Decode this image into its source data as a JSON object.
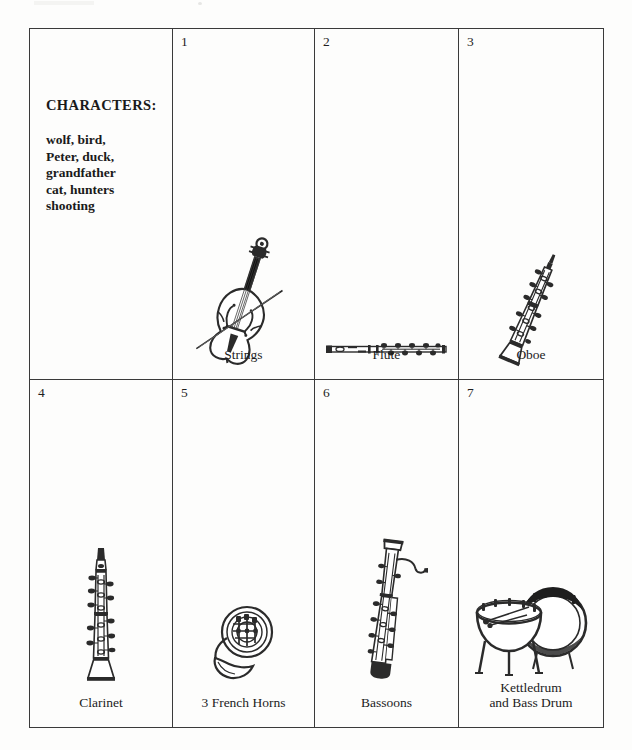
{
  "document": {
    "title": "Peter and the Wolf instrument chart",
    "background_color": "#fdfdfc",
    "border_color": "#3a3a3a",
    "ink_color": "#1a1a1a"
  },
  "characters_cell": {
    "heading": "CHARACTERS:",
    "lines": [
      "wolf, bird,",
      "Peter, duck,",
      "grandfather",
      "cat, hunters",
      "shooting"
    ]
  },
  "cells": [
    {
      "number": "1",
      "label": "Strings",
      "icon": "double-bass-icon",
      "label_lines": [
        "Strings"
      ]
    },
    {
      "number": "2",
      "label": "Flute",
      "icon": "flute-icon",
      "label_lines": [
        "Flute"
      ]
    },
    {
      "number": "3",
      "label": "Oboe",
      "icon": "oboe-icon",
      "label_lines": [
        "Oboe"
      ]
    },
    {
      "number": "4",
      "label": "Clarinet",
      "icon": "clarinet-icon",
      "label_lines": [
        "Clarinet"
      ]
    },
    {
      "number": "5",
      "label": "3 French Horns",
      "icon": "french-horn-icon",
      "label_lines": [
        "3 French Horns"
      ]
    },
    {
      "number": "6",
      "label": "Bassoons",
      "icon": "bassoon-icon",
      "label_lines": [
        "Bassoons"
      ]
    },
    {
      "number": "7",
      "label": "Kettledrum and Bass Drum",
      "icon": "kettledrum-bass-drum-icon",
      "label_lines": [
        "Kettledrum",
        "and Bass Drum"
      ]
    }
  ]
}
